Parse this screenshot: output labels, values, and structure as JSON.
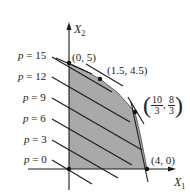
{
  "diagram": {
    "type": "linear-programming-feasible-region",
    "axes": {
      "x_label": "X",
      "x_sub": "1",
      "y_label": "X",
      "y_sub": "2"
    },
    "iso_lines": [
      {
        "label_var": "p",
        "label_eq": "=",
        "value": "15"
      },
      {
        "label_var": "p",
        "label_eq": "=",
        "value": "12"
      },
      {
        "label_var": "p",
        "label_eq": "=",
        "value": "9"
      },
      {
        "label_var": "p",
        "label_eq": "=",
        "value": "6"
      },
      {
        "label_var": "p",
        "label_eq": "=",
        "value": "3"
      },
      {
        "label_var": "p",
        "label_eq": "=",
        "value": "0"
      }
    ],
    "vertices": [
      {
        "label": "(0, 5)",
        "x": 0,
        "y": 5
      },
      {
        "label": "(1.5, 4.5)",
        "x": 1.5,
        "y": 4.5
      },
      {
        "label_num_x": "10",
        "label_den_x": "3",
        "label_num_y": "8",
        "label_den_y": "3",
        "x": 3.333,
        "y": 2.667
      },
      {
        "label": "(4, 0)",
        "x": 4,
        "y": 0
      }
    ],
    "colors": {
      "region_fill": "#a9a9a9",
      "lines": "#1a1a1a",
      "background": "#ffffff"
    }
  }
}
